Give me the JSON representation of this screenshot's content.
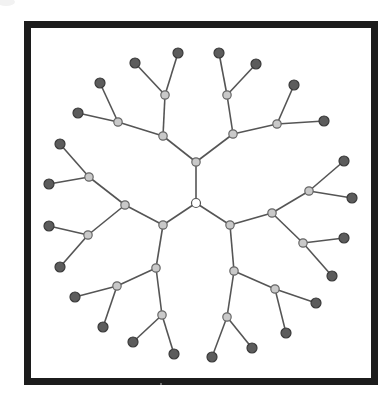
{
  "diagram": {
    "type": "tree",
    "frame": {
      "x": 27.5,
      "y": 24.5,
      "width": 347,
      "height": 357,
      "stroke": "#1c1c1c",
      "stroke_width": 7
    },
    "colors": {
      "root_fill": "#ffffff",
      "inner_fill": "#c9c9c9",
      "leaf_fill": "#5c5c5c",
      "edge": "#555555"
    },
    "node_radius": {
      "root": 4.5,
      "inner": 4.2,
      "leaf": 5
    },
    "nodes": [
      {
        "id": "r",
        "x": 196,
        "y": 203,
        "level": 0
      },
      {
        "id": "a",
        "x": 196,
        "y": 162,
        "level": 1,
        "parent": "r"
      },
      {
        "id": "b",
        "x": 163,
        "y": 225,
        "level": 1,
        "parent": "r"
      },
      {
        "id": "c",
        "x": 230,
        "y": 225,
        "level": 1,
        "parent": "r"
      },
      {
        "id": "a1",
        "x": 163,
        "y": 136,
        "level": 2,
        "parent": "a"
      },
      {
        "id": "a2",
        "x": 233,
        "y": 134,
        "level": 2,
        "parent": "a"
      },
      {
        "id": "b1",
        "x": 125,
        "y": 205,
        "level": 2,
        "parent": "b"
      },
      {
        "id": "b2",
        "x": 156,
        "y": 268,
        "level": 2,
        "parent": "b"
      },
      {
        "id": "c1",
        "x": 272,
        "y": 213,
        "level": 2,
        "parent": "c"
      },
      {
        "id": "c2",
        "x": 234,
        "y": 271,
        "level": 2,
        "parent": "c"
      },
      {
        "id": "a1a",
        "x": 118,
        "y": 122,
        "level": 3,
        "parent": "a1"
      },
      {
        "id": "a1b",
        "x": 165,
        "y": 95,
        "level": 3,
        "parent": "a1"
      },
      {
        "id": "a2a",
        "x": 227,
        "y": 95,
        "level": 3,
        "parent": "a2"
      },
      {
        "id": "a2b",
        "x": 277,
        "y": 124,
        "level": 3,
        "parent": "a2"
      },
      {
        "id": "b1a",
        "x": 89,
        "y": 177,
        "level": 3,
        "parent": "b1"
      },
      {
        "id": "b1b",
        "x": 88,
        "y": 235,
        "level": 3,
        "parent": "b1"
      },
      {
        "id": "b2a",
        "x": 117,
        "y": 286,
        "level": 3,
        "parent": "b2"
      },
      {
        "id": "b2b",
        "x": 162,
        "y": 315,
        "level": 3,
        "parent": "b2"
      },
      {
        "id": "c1a",
        "x": 309,
        "y": 191,
        "level": 3,
        "parent": "c1"
      },
      {
        "id": "c1b",
        "x": 303,
        "y": 243,
        "level": 3,
        "parent": "c1"
      },
      {
        "id": "c2a",
        "x": 275,
        "y": 289,
        "level": 3,
        "parent": "c2"
      },
      {
        "id": "c2b",
        "x": 227,
        "y": 317,
        "level": 3,
        "parent": "c2"
      },
      {
        "id": "a1a1",
        "x": 78,
        "y": 113,
        "level": 4,
        "parent": "a1a"
      },
      {
        "id": "a1a2",
        "x": 100,
        "y": 83,
        "level": 4,
        "parent": "a1a"
      },
      {
        "id": "a1b1",
        "x": 135,
        "y": 63,
        "level": 4,
        "parent": "a1b"
      },
      {
        "id": "a1b2",
        "x": 178,
        "y": 53,
        "level": 4,
        "parent": "a1b"
      },
      {
        "id": "a2a1",
        "x": 219,
        "y": 53,
        "level": 4,
        "parent": "a2a"
      },
      {
        "id": "a2a2",
        "x": 256,
        "y": 64,
        "level": 4,
        "parent": "a2a"
      },
      {
        "id": "a2b1",
        "x": 294,
        "y": 85,
        "level": 4,
        "parent": "a2b"
      },
      {
        "id": "a2b2",
        "x": 324,
        "y": 121,
        "level": 4,
        "parent": "a2b"
      },
      {
        "id": "b1a1",
        "x": 60,
        "y": 144,
        "level": 4,
        "parent": "b1a"
      },
      {
        "id": "b1a2",
        "x": 49,
        "y": 184,
        "level": 4,
        "parent": "b1a"
      },
      {
        "id": "b1b1",
        "x": 49,
        "y": 226,
        "level": 4,
        "parent": "b1b"
      },
      {
        "id": "b1b2",
        "x": 60,
        "y": 267,
        "level": 4,
        "parent": "b1b"
      },
      {
        "id": "b2a1",
        "x": 75,
        "y": 297,
        "level": 4,
        "parent": "b2a"
      },
      {
        "id": "b2a2",
        "x": 103,
        "y": 327,
        "level": 4,
        "parent": "b2a"
      },
      {
        "id": "b2b1",
        "x": 133,
        "y": 342,
        "level": 4,
        "parent": "b2b"
      },
      {
        "id": "b2b2",
        "x": 174,
        "y": 354,
        "level": 4,
        "parent": "b2b"
      },
      {
        "id": "c1a1",
        "x": 344,
        "y": 161,
        "level": 4,
        "parent": "c1a"
      },
      {
        "id": "c1a2",
        "x": 352,
        "y": 198,
        "level": 4,
        "parent": "c1a"
      },
      {
        "id": "c1b1",
        "x": 344,
        "y": 238,
        "level": 4,
        "parent": "c1b"
      },
      {
        "id": "c1b2",
        "x": 332,
        "y": 276,
        "level": 4,
        "parent": "c1b"
      },
      {
        "id": "c2a1",
        "x": 316,
        "y": 303,
        "level": 4,
        "parent": "c2a"
      },
      {
        "id": "c2a2",
        "x": 286,
        "y": 333,
        "level": 4,
        "parent": "c2a"
      },
      {
        "id": "c2b1",
        "x": 252,
        "y": 348,
        "level": 4,
        "parent": "c2b"
      },
      {
        "id": "c2b2",
        "x": 212,
        "y": 357,
        "level": 4,
        "parent": "c2b"
      }
    ]
  }
}
